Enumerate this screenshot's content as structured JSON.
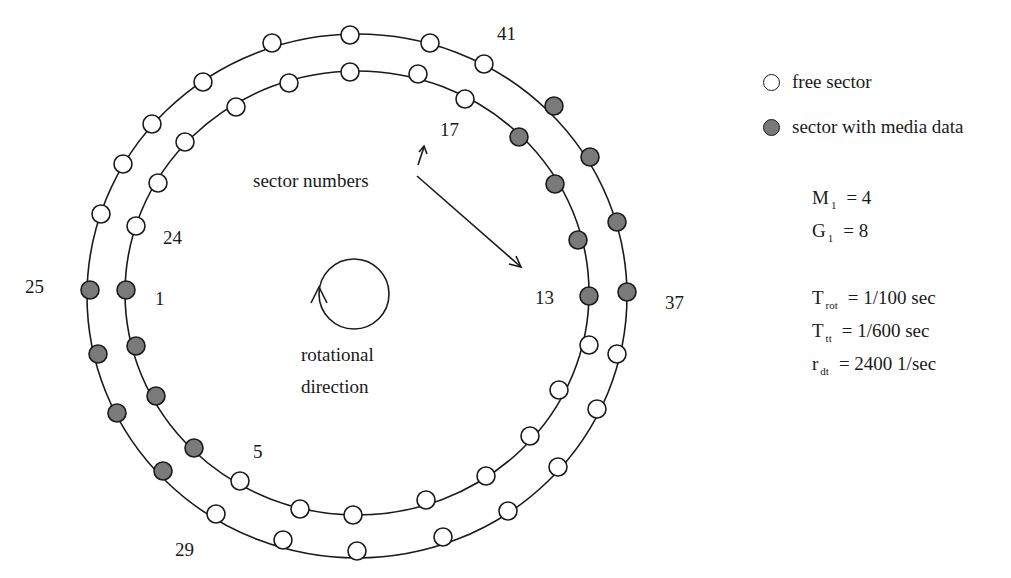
{
  "legend": {
    "free": {
      "label": "free sector",
      "fill": "#ffffff"
    },
    "media": {
      "label": "sector with media data",
      "fill": "#7a7a7a"
    }
  },
  "annotations": {
    "sector_numbers": "sector numbers",
    "rotational_line1": "rotational",
    "rotational_line2": "direction"
  },
  "sector_labels": [
    {
      "text": "41",
      "x": 497,
      "y": 24
    },
    {
      "text": "17",
      "x": 440,
      "y": 120
    },
    {
      "text": "24",
      "x": 163,
      "y": 228
    },
    {
      "text": "25",
      "x": 25,
      "y": 277
    },
    {
      "text": "1",
      "x": 155,
      "y": 289
    },
    {
      "text": "13",
      "x": 535,
      "y": 288
    },
    {
      "text": "37",
      "x": 665,
      "y": 293
    },
    {
      "text": "5",
      "x": 253,
      "y": 442
    },
    {
      "text": "29",
      "x": 175,
      "y": 540
    }
  ],
  "parameters": {
    "M": {
      "symbol": "M",
      "sub": "1",
      "value": "= 4"
    },
    "G": {
      "symbol": "G",
      "sub": "1",
      "value": "=  8"
    },
    "Trot": {
      "symbol": "T",
      "sub": "rot",
      "value": "= 1/100 sec"
    },
    "Ttt": {
      "symbol": "T",
      "sub": "tt",
      "value": "= 1/600 sec"
    },
    "rdt": {
      "symbol": "r",
      "sub": "dt",
      "value": "= 2400 1/sec"
    }
  },
  "tracks": {
    "outer": {
      "ellipse": {
        "cx": 357,
        "cy": 296,
        "rx": 270,
        "ry": 262
      },
      "sectors": [
        [
          350,
          35,
          0
        ],
        [
          430,
          43,
          0
        ],
        [
          484,
          64,
          0
        ],
        [
          554,
          106,
          1
        ],
        [
          590,
          157,
          1
        ],
        [
          617,
          222,
          1
        ],
        [
          627,
          292,
          1
        ],
        [
          617,
          354,
          0
        ],
        [
          597,
          409,
          0
        ],
        [
          558,
          467,
          0
        ],
        [
          508,
          511,
          0
        ],
        [
          443,
          537,
          0
        ],
        [
          357,
          551,
          0
        ],
        [
          283,
          540,
          0
        ],
        [
          216,
          514,
          0
        ],
        [
          163,
          471,
          1
        ],
        [
          117,
          413,
          1
        ],
        [
          98,
          354,
          1
        ],
        [
          90,
          290,
          1
        ],
        [
          101,
          214,
          0
        ],
        [
          123,
          164,
          0
        ],
        [
          152,
          124,
          0
        ],
        [
          203,
          82,
          0
        ],
        [
          272,
          43,
          0
        ]
      ]
    },
    "inner": {
      "ellipse": {
        "cx": 357,
        "cy": 293,
        "rx": 232,
        "ry": 222
      },
      "sectors": [
        [
          350,
          72,
          0
        ],
        [
          418,
          74,
          0
        ],
        [
          465,
          99,
          0
        ],
        [
          519,
          137,
          1
        ],
        [
          555,
          184,
          1
        ],
        [
          578,
          240,
          1
        ],
        [
          589,
          296,
          1
        ],
        [
          589,
          345,
          0
        ],
        [
          559,
          390,
          0
        ],
        [
          530,
          436,
          0
        ],
        [
          486,
          476,
          0
        ],
        [
          426,
          500,
          0
        ],
        [
          353,
          515,
          0
        ],
        [
          300,
          509,
          0
        ],
        [
          240,
          481,
          0
        ],
        [
          194,
          448,
          1
        ],
        [
          156,
          396,
          1
        ],
        [
          136,
          346,
          1
        ],
        [
          126,
          290,
          1
        ],
        [
          136,
          226,
          0
        ],
        [
          158,
          183,
          0
        ],
        [
          185,
          142,
          0
        ],
        [
          236,
          107,
          0
        ],
        [
          289,
          83,
          0
        ]
      ]
    }
  },
  "colors": {
    "stroke": "#1a1a1a",
    "media_fill": "#7a7a7a",
    "free_fill": "#ffffff"
  }
}
